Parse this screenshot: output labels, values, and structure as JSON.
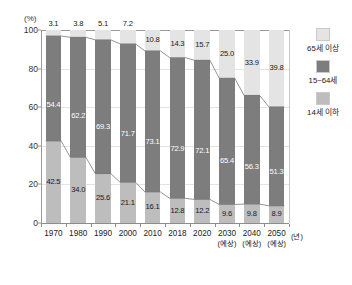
{
  "chart_data": {
    "type": "bar",
    "subtype": "stacked-percentage",
    "title": "",
    "xlabel": "(년)",
    "ylabel": "(%)",
    "ylim": [
      0,
      100
    ],
    "yticks": [
      "100",
      "80",
      "60",
      "40",
      "20",
      "0"
    ],
    "grid": true,
    "legend_position": "right",
    "categories": [
      "1970",
      "1980",
      "1990",
      "2000",
      "2010",
      "2018",
      "2020",
      "2030",
      "2040",
      "2050"
    ],
    "category_sublabels": [
      "",
      "",
      "",
      "",
      "",
      "",
      "",
      "(예상)",
      "(예상)",
      "(예상)"
    ],
    "series": [
      {
        "name": "65세 이상",
        "color": "#e4e4e4",
        "values": [
          3.1,
          3.8,
          5.1,
          7.2,
          10.8,
          14.3,
          15.7,
          25.0,
          33.9,
          39.8
        ]
      },
      {
        "name": "15~64세",
        "color": "#7d7d7d",
        "values": [
          54.4,
          62.2,
          69.3,
          71.7,
          73.1,
          72.9,
          72.1,
          65.4,
          56.3,
          51.3
        ]
      },
      {
        "name": "14세 이하",
        "color": "#bdbdbd",
        "values": [
          42.5,
          34.0,
          25.6,
          21.1,
          16.1,
          12.8,
          12.2,
          9.6,
          9.8,
          8.9
        ]
      }
    ]
  },
  "legend": {
    "items": [
      {
        "label": "65세 이상",
        "color": "#e4e4e4"
      },
      {
        "label": "15~64세",
        "color": "#7d7d7d"
      },
      {
        "label": "14세 이하",
        "color": "#bdbdbd"
      }
    ]
  },
  "axes": {
    "y_unit": "(%)",
    "x_unit": "(년)"
  }
}
